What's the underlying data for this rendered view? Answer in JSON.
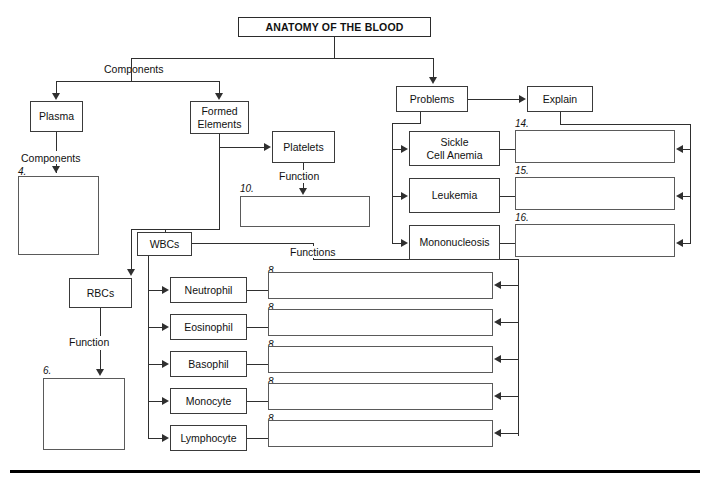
{
  "diagram": {
    "title": "ANATOMY OF THE BLOOD",
    "labels": {
      "components_top": "Components",
      "components_plasma": "Components",
      "function_platelets": "Function",
      "function_rbcs": "Function",
      "functions_wbcs": "Functions"
    },
    "nodes": {
      "plasma": "Plasma",
      "formed_elements": "Formed\nElements",
      "formed_elements_line1": "Formed",
      "formed_elements_line2": "Elements",
      "platelets": "Platelets",
      "wbcs": "WBCs",
      "rbcs": "RBCs",
      "problems": "Problems",
      "explain": "Explain"
    },
    "wbc_types": [
      {
        "name": "Neutrophil",
        "blank_number": "8."
      },
      {
        "name": "Eosinophil",
        "blank_number": "8."
      },
      {
        "name": "Basophil",
        "blank_number": "8."
      },
      {
        "name": "Monocyte",
        "blank_number": "8."
      },
      {
        "name": "Lymphocyte",
        "blank_number": "8."
      }
    ],
    "problems_list": [
      {
        "name_line1": "Sickle",
        "name_line2": "Cell Anemia",
        "blank_number": "14."
      },
      {
        "name_line1": "Leukemia",
        "name_line2": "",
        "blank_number": "15."
      },
      {
        "name_line1": "Mononucleosis",
        "name_line2": "",
        "blank_number": "16."
      }
    ],
    "blank_numbers": {
      "plasma_components": "4.",
      "rbcs_function": "6.",
      "platelets_function": "10."
    },
    "colors": {
      "line": "#2f2f2f",
      "box_border": "#3a3a3a",
      "text": "#111111",
      "background": "#ffffff",
      "rule": "#000000"
    }
  }
}
